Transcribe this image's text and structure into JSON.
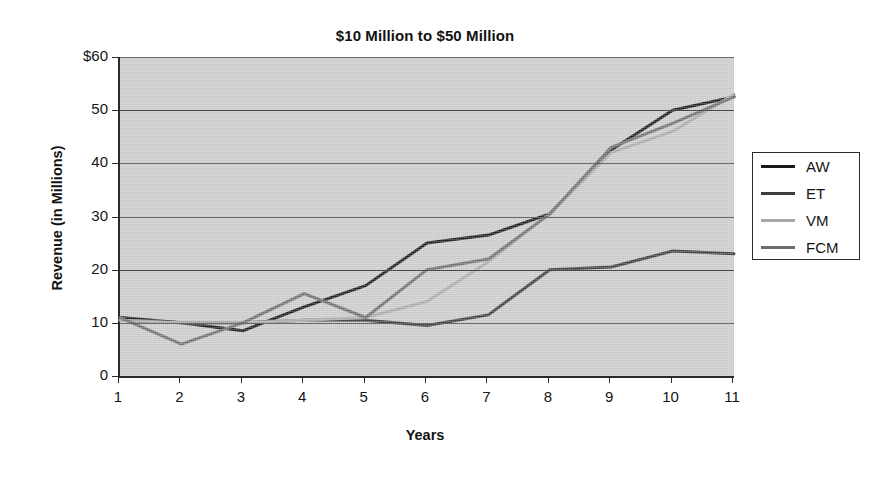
{
  "chart_data": {
    "type": "line",
    "title": "$10 Million to $50 Million",
    "xlabel": "Years",
    "ylabel": "Revenue (in Millions)",
    "categories": [
      1,
      2,
      3,
      4,
      5,
      6,
      7,
      8,
      9,
      10,
      11
    ],
    "x_tick_labels": [
      "1",
      "2",
      "3",
      "4",
      "5",
      "6",
      "7",
      "8",
      "9",
      "10",
      "11"
    ],
    "y_tick_labels": [
      "0",
      "10",
      "20",
      "30",
      "40",
      "50",
      "$60"
    ],
    "y_tick_values": [
      0,
      10,
      20,
      30,
      40,
      50,
      60
    ],
    "ylim": [
      0,
      60
    ],
    "xlim": [
      1,
      11
    ],
    "grid": "horizontal",
    "legend_position": "right",
    "plot_background": "#c9c9c9",
    "series": [
      {
        "name": "AW",
        "color": "#1a1a1a",
        "values": [
          11,
          10,
          8.5,
          13,
          17,
          25,
          26.5,
          30.5,
          42.5,
          50,
          52.5
        ]
      },
      {
        "name": "ET",
        "color": "#3d3d3d",
        "values": [
          10.5,
          10,
          10,
          10.5,
          10.5,
          9.5,
          11.5,
          20,
          20.5,
          23.5,
          23
        ]
      },
      {
        "name": "VM",
        "color": "#a8a8a8",
        "values": [
          10.5,
          10,
          10,
          10.5,
          11,
          14,
          21.5,
          30.5,
          42,
          46,
          53
        ]
      },
      {
        "name": "FCM",
        "color": "#6e6e6e",
        "values": [
          11,
          6,
          10,
          15.5,
          11,
          20,
          22,
          30.5,
          43,
          47.5,
          52.5
        ]
      }
    ]
  },
  "legend": {
    "entries": [
      {
        "label": "AW"
      },
      {
        "label": "ET"
      },
      {
        "label": "VM"
      },
      {
        "label": "FCM"
      }
    ]
  }
}
